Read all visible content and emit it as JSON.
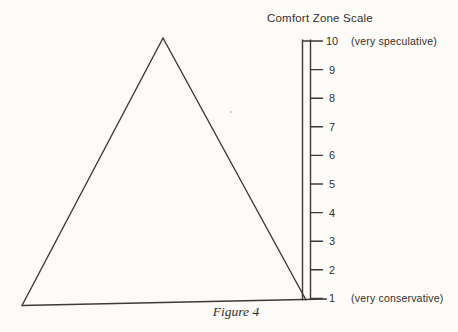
{
  "figure": {
    "scale_title": "Comfort Zone Scale",
    "caption": "Figure 4",
    "scale": {
      "min": 1,
      "max": 10,
      "ticks": [
        10,
        9,
        8,
        7,
        6,
        5,
        4,
        3,
        2,
        1
      ],
      "max_annotation": "(very speculative)",
      "min_annotation": "(very conservative)"
    },
    "colors": {
      "ink": "#3d3b38",
      "paper": "#fcfbf8"
    }
  }
}
